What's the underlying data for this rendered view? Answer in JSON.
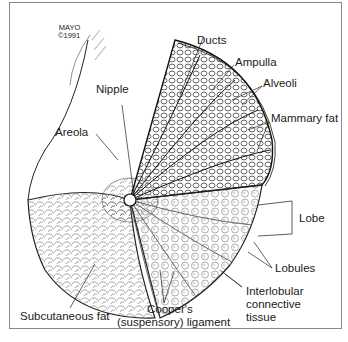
{
  "credit": {
    "line1": "MAYO",
    "line2": "©1991"
  },
  "labels": {
    "ducts": "Ducts",
    "ampulla": "Ampulla",
    "alveoli": "Alveoli",
    "nipple": "Nipple",
    "areola": "Areola",
    "mammary_fat": "Mammary fat",
    "lobe": "Lobe",
    "lobules": "Lobules",
    "interlobular_1": "Interlobular",
    "interlobular_2": "connective",
    "interlobular_3": "tissue",
    "subcutaneous_fat": "Subcutaneous fat",
    "coopers_1": "Cooper's",
    "coopers_2": "(suspensory) ligament"
  },
  "colors": {
    "ink": "#1a1a1a",
    "frame": "#8a8a8a",
    "background": "#ffffff"
  }
}
